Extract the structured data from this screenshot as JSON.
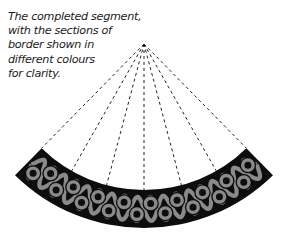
{
  "caption": {
    "lines": [
      "The completed segment,",
      "with the sections of",
      "border shown in",
      "different colours",
      "for clarity."
    ]
  },
  "diagram": {
    "type": "celtic-knot-border-segment",
    "apex": [
      144,
      44
    ],
    "inner_radius": 146,
    "outer_radius": 184,
    "guide_lines": 7,
    "colors": {
      "band": "#0d0d0d",
      "knot": "#8a8a8a",
      "guide": "#222222"
    }
  }
}
